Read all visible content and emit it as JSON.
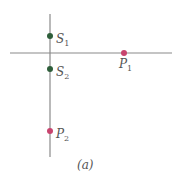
{
  "diagram": {
    "caption": "(a)",
    "colors": {
      "axis": "#8a8a8a",
      "source": "#2e5e3a",
      "point": "#c8446e",
      "text": "#555555"
    },
    "points": [
      {
        "id": "S1",
        "base": "S",
        "sub": "1",
        "kind": "source",
        "x": 50,
        "y": 36
      },
      {
        "id": "S2",
        "base": "S",
        "sub": "2",
        "kind": "source",
        "x": 50,
        "y": 69
      },
      {
        "id": "P1",
        "base": "P",
        "sub": "1",
        "kind": "point",
        "x": 124,
        "y": 53
      },
      {
        "id": "P2",
        "base": "P",
        "sub": "2",
        "kind": "point",
        "x": 50,
        "y": 131
      }
    ]
  }
}
